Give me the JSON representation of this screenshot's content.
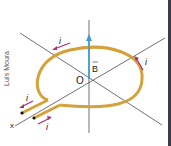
{
  "diagram": {
    "credit": "Luís Moura",
    "labels": {
      "origin": "O",
      "field": "B",
      "axis": "x",
      "current_top": "i",
      "current_right": "i",
      "current_lead_top": "i",
      "current_lead_bottom": "i"
    },
    "colors": {
      "wire": "#d4a23a",
      "field_arrow": "#3a9ad9",
      "current_arrows": "#b0306e",
      "axes": "#333333",
      "edge": "#3a3a48"
    }
  }
}
